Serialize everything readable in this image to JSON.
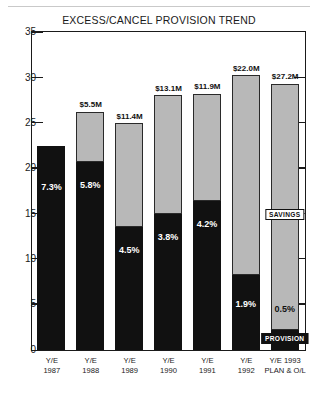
{
  "page": {
    "rule_present": true
  },
  "chart_data": {
    "type": "bar",
    "title": "EXCESS/CANCEL PROVISION TREND",
    "subtitle": "",
    "annotation": "Baseline = 7.3% of receipts",
    "xlabel": "",
    "ylabel": "",
    "ylim": [
      0,
      35
    ],
    "yticks": [
      0,
      5,
      10,
      15,
      20,
      25,
      30,
      35
    ],
    "ytick_labels": [
      "0",
      "5",
      "10",
      "15",
      "20",
      "25",
      "30",
      "35"
    ],
    "grid": false,
    "legend_position": "in-plot-last-bar",
    "stacked": true,
    "categories": [
      "Y/E 1987",
      "Y/E 1988",
      "Y/E 1989",
      "Y/E 1990",
      "Y/E 1991",
      "Y/E 1992",
      "Y/E 1993 PLAN & O/L"
    ],
    "category_lines": [
      [
        "Y/E",
        "1987"
      ],
      [
        "Y/E",
        "1988"
      ],
      [
        "Y/E",
        "1989"
      ],
      [
        "Y/E",
        "1990"
      ],
      [
        "Y/E",
        "1991"
      ],
      [
        "Y/E",
        "1992"
      ],
      [
        "Y/E 1993",
        "PLAN & O/L"
      ]
    ],
    "series": [
      {
        "name": "PROVISION",
        "color": "#111111",
        "values": [
          22.5,
          20.8,
          13.6,
          15.0,
          16.4,
          8.3,
          2.2
        ]
      },
      {
        "name": "SAVINGS",
        "color": "#b8b8b8",
        "values": [
          0.0,
          5.5,
          11.4,
          13.1,
          11.9,
          22.0,
          27.2
        ]
      }
    ],
    "totals": [
      22.5,
      26.3,
      25.0,
      28.1,
      28.3,
      30.3,
      29.4
    ],
    "value_labels": [
      "",
      "$5.5M",
      "$11.4M",
      "$13.1M",
      "$11.9M",
      "$22.0M",
      "$27.2M"
    ],
    "percent_labels": [
      "7.3%",
      "5.8%",
      "4.5%",
      "3.8%",
      "4.2%",
      "1.9%",
      "0.5%"
    ],
    "percent_label_color": [
      "white",
      "white",
      "white",
      "white",
      "white",
      "white",
      "dark"
    ],
    "inline_labels": {
      "savings": "SAVINGS",
      "provision": "PROVISION"
    }
  }
}
